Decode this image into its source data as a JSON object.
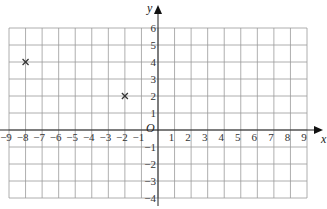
{
  "chart_data": {
    "type": "scatter",
    "title": "",
    "xlabel": "x",
    "ylabel": "y",
    "origin_label": "O",
    "xlim": [
      -9,
      9
    ],
    "ylim": [
      -4,
      6
    ],
    "grid": true,
    "x_ticks": [
      -9,
      -8,
      -7,
      -6,
      -5,
      -4,
      -3,
      -2,
      -1,
      1,
      2,
      3,
      4,
      5,
      6,
      7,
      8,
      9
    ],
    "y_ticks": [
      -4,
      -3,
      -2,
      -1,
      1,
      2,
      3,
      4,
      5,
      6
    ],
    "points": [
      {
        "x": -8,
        "y": 4,
        "marker": "cross"
      },
      {
        "x": -2,
        "y": 2,
        "marker": "cross"
      }
    ]
  }
}
